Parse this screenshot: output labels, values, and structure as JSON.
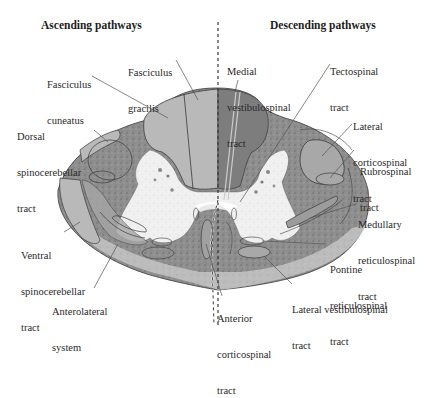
{
  "headers": {
    "ascending": "Ascending pathways",
    "descending": "Descending pathways"
  },
  "colors": {
    "tract_fill": "#b9b9b9",
    "white_matter": "#8a8a8a",
    "gray_matter": "#eeeeee",
    "outline": "#3a3a3a",
    "leader": "#555555",
    "text": "#2a2a2a"
  },
  "labels": {
    "fasciculus_gracilis": [
      "Fasciculus",
      "gracilis"
    ],
    "fasciculus_cuneatus": [
      "Fasciculus",
      "cuneatus"
    ],
    "dorsal_spinocerebellar": [
      "Dorsal",
      "spinocerebellar",
      "tract"
    ],
    "ventral_spinocerebellar": [
      "Ventral",
      "spinocerebellar",
      "tract"
    ],
    "anterolateral": [
      "Anterolateral",
      "system"
    ],
    "medial_vestibulospinal": [
      "Medial",
      "vestibulospinal",
      "tract"
    ],
    "tectospinal": [
      "Tectospinal",
      "tract"
    ],
    "lateral_corticospinal": [
      "Lateral",
      "corticospinal",
      "tract"
    ],
    "rubrospinal": [
      "Rubrospinal",
      "tract"
    ],
    "medullary_reticulospinal": [
      "Medullary",
      "reticulospinal",
      "tract"
    ],
    "pontine_reticulospinal": [
      "Pontine",
      "reticulospinal",
      "tract"
    ],
    "lateral_vestibulospinal": [
      "Lateral vestibulospinal",
      "tract"
    ],
    "anterior_corticospinal": [
      "Anterior",
      "corticospinal",
      "tract"
    ]
  }
}
